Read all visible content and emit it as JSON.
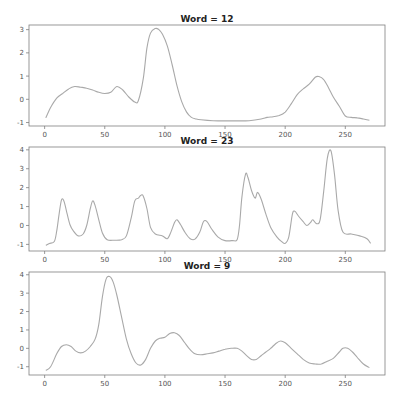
{
  "chart_data": [
    {
      "type": "line",
      "title": "Word = 12",
      "xlabel": "",
      "ylabel": "",
      "xlim": [
        -13,
        283
      ],
      "ylim": [
        -1.15,
        3.2
      ],
      "xticks": [
        0,
        50,
        100,
        150,
        200,
        250
      ],
      "yticks": [
        -1,
        0,
        1,
        2,
        3
      ],
      "grid": false,
      "x": [
        1,
        5,
        10,
        15,
        20,
        25,
        30,
        35,
        40,
        45,
        50,
        55,
        60,
        65,
        70,
        75,
        78,
        82,
        85,
        88,
        92,
        95,
        98,
        102,
        106,
        110,
        114,
        118,
        122,
        126,
        130,
        140,
        150,
        160,
        170,
        180,
        185,
        190,
        195,
        200,
        205,
        210,
        215,
        220,
        225,
        228,
        232,
        236,
        240,
        245,
        250,
        255,
        260,
        265,
        270
      ],
      "series": [
        {
          "name": "Word 12",
          "values": [
            -0.8,
            -0.35,
            0.05,
            0.25,
            0.45,
            0.55,
            0.52,
            0.48,
            0.4,
            0.3,
            0.25,
            0.3,
            0.55,
            0.4,
            0.1,
            -0.12,
            -0.05,
            0.9,
            2.2,
            2.85,
            3.05,
            3.0,
            2.8,
            2.3,
            1.5,
            0.6,
            -0.1,
            -0.55,
            -0.78,
            -0.85,
            -0.88,
            -0.92,
            -0.93,
            -0.93,
            -0.92,
            -0.85,
            -0.78,
            -0.75,
            -0.7,
            -0.55,
            -0.2,
            0.2,
            0.45,
            0.65,
            0.95,
            0.98,
            0.85,
            0.5,
            0.1,
            -0.3,
            -0.72,
            -0.78,
            -0.8,
            -0.85,
            -0.9
          ]
        }
      ]
    },
    {
      "type": "line",
      "title": "Word = 23",
      "xlabel": "",
      "ylabel": "",
      "xlim": [
        -13,
        283
      ],
      "ylim": [
        -1.35,
        4.15
      ],
      "xticks": [
        0,
        50,
        100,
        150,
        200,
        250
      ],
      "yticks": [
        -1,
        0,
        1,
        2,
        3,
        4
      ],
      "grid": false,
      "x": [
        1,
        4,
        8,
        10,
        12,
        14,
        16,
        18,
        21,
        24,
        28,
        32,
        35,
        38,
        40,
        42,
        45,
        48,
        52,
        58,
        64,
        68,
        72,
        75,
        78,
        80,
        82,
        85,
        88,
        92,
        98,
        102,
        105,
        108,
        110,
        113,
        117,
        121,
        125,
        129,
        132,
        135,
        139,
        144,
        150,
        156,
        160,
        162,
        164,
        167,
        169,
        172,
        175,
        177,
        180,
        184,
        188,
        193,
        197,
        200,
        203,
        206,
        208,
        211,
        215,
        218,
        221,
        223,
        226,
        229,
        232,
        235,
        238,
        241,
        244,
        248,
        255,
        262,
        268,
        271
      ],
      "series": [
        {
          "name": "Word 23",
          "values": [
            -1.05,
            -0.95,
            -0.85,
            -0.3,
            0.6,
            1.35,
            1.3,
            0.8,
            0.05,
            -0.3,
            -0.55,
            -0.45,
            0.0,
            0.9,
            1.3,
            1.05,
            0.3,
            -0.4,
            -0.75,
            -0.78,
            -0.75,
            -0.55,
            0.4,
            1.3,
            1.45,
            1.6,
            1.55,
            0.9,
            -0.1,
            -0.45,
            -0.55,
            -0.7,
            -0.35,
            0.15,
            0.3,
            0.05,
            -0.4,
            -0.7,
            -0.72,
            -0.35,
            0.2,
            0.2,
            -0.2,
            -0.6,
            -0.8,
            -0.8,
            -0.75,
            0.0,
            1.5,
            2.7,
            2.55,
            1.85,
            1.45,
            1.75,
            1.4,
            0.6,
            -0.1,
            -0.6,
            -0.85,
            -0.95,
            -0.6,
            0.6,
            0.75,
            0.5,
            0.2,
            0.0,
            0.15,
            0.3,
            0.1,
            0.3,
            1.8,
            3.55,
            3.95,
            2.7,
            0.8,
            -0.35,
            -0.45,
            -0.55,
            -0.7,
            -0.95
          ]
        }
      ]
    },
    {
      "type": "line",
      "title": "Word = 9",
      "xlabel": "",
      "ylabel": "",
      "xlim": [
        -13,
        283
      ],
      "ylim": [
        -1.45,
        4.15
      ],
      "xticks": [
        0,
        50,
        100,
        150,
        200,
        250
      ],
      "yticks": [
        -1,
        0,
        1,
        2,
        3,
        4
      ],
      "grid": false,
      "x": [
        1,
        5,
        10,
        14,
        18,
        22,
        26,
        30,
        34,
        38,
        42,
        45,
        48,
        51,
        54,
        57,
        60,
        64,
        68,
        72,
        76,
        80,
        84,
        88,
        92,
        96,
        100,
        104,
        108,
        112,
        116,
        120,
        125,
        130,
        135,
        140,
        145,
        150,
        155,
        160,
        164,
        168,
        172,
        176,
        180,
        184,
        188,
        192,
        196,
        200,
        205,
        210,
        215,
        220,
        225,
        230,
        235,
        240,
        245,
        248,
        252,
        256,
        260,
        265,
        270
      ],
      "series": [
        {
          "name": "Word 9",
          "values": [
            -1.2,
            -1.0,
            -0.3,
            0.1,
            0.2,
            0.1,
            -0.15,
            -0.25,
            -0.15,
            0.1,
            0.5,
            1.3,
            2.8,
            3.75,
            3.9,
            3.6,
            2.9,
            1.7,
            0.5,
            -0.3,
            -0.8,
            -0.9,
            -0.6,
            0.0,
            0.4,
            0.55,
            0.6,
            0.8,
            0.85,
            0.7,
            0.35,
            0.0,
            -0.3,
            -0.35,
            -0.3,
            -0.25,
            -0.15,
            -0.05,
            0.0,
            0.0,
            -0.15,
            -0.4,
            -0.6,
            -0.6,
            -0.4,
            -0.2,
            0.0,
            0.25,
            0.4,
            0.3,
            0.0,
            -0.3,
            -0.6,
            -0.8,
            -0.85,
            -0.85,
            -0.7,
            -0.55,
            -0.2,
            0.0,
            0.0,
            -0.2,
            -0.5,
            -0.85,
            -1.05
          ]
        }
      ]
    }
  ],
  "colors": {
    "line": "#a9a9a9",
    "axes": "#7f7f7f",
    "background": "#ffffff"
  }
}
